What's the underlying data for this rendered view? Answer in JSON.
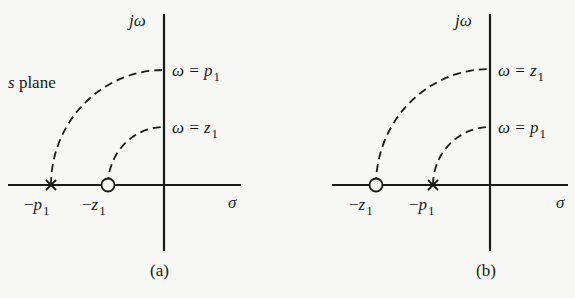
{
  "panel_a": {
    "plane_label_s": "s",
    "plane_label_text": " plane",
    "vertical_axis_label": "jω",
    "horizontal_axis_label": "σ",
    "upper_label_lhs": "ω = ",
    "upper_label_var": "p",
    "upper_label_sub": "1",
    "lower_label_lhs": "ω = ",
    "lower_label_var": "z",
    "lower_label_sub": "1",
    "pole_label_minus": "−",
    "pole_label_var": "p",
    "pole_label_sub": "1",
    "zero_label_minus": "−",
    "zero_label_var": "z",
    "zero_label_sub": "1",
    "caption": "(a)"
  },
  "panel_b": {
    "vertical_axis_label": "jω",
    "horizontal_axis_label": "σ",
    "upper_label_lhs": "ω = ",
    "upper_label_var": "z",
    "upper_label_sub": "1",
    "lower_label_lhs": "ω = ",
    "lower_label_var": "p",
    "lower_label_sub": "1",
    "zero_label_minus": "−",
    "zero_label_var": "z",
    "zero_label_sub": "1",
    "pole_label_minus": "−",
    "pole_label_var": "p",
    "pole_label_sub": "1",
    "caption": "(b)"
  },
  "colors": {
    "ink": "#1a1a1a",
    "paper": "#f7f7f5"
  }
}
